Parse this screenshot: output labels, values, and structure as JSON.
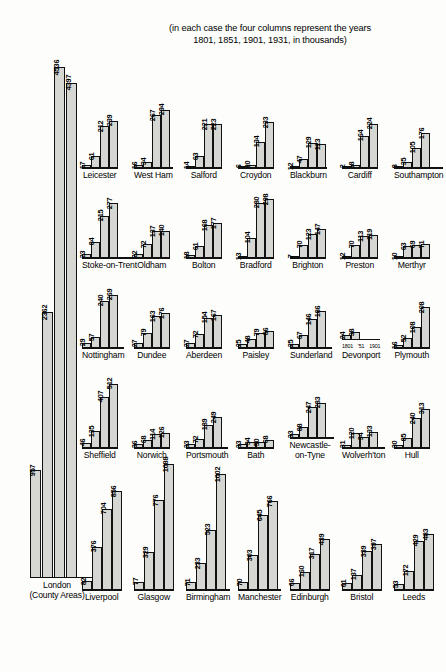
{
  "caption": {
    "line1": "(in each case the four columns represent the years",
    "line2": "1801, 1851, 1901, 1931, in thousands)"
  },
  "year_axis": {
    "ticks": [
      "1801",
      "'51",
      "1901"
    ],
    "years": [
      1801,
      1851,
      1901,
      1931
    ]
  },
  "chart_data": {
    "type": "bar",
    "title": "(in each case the four columns represent the years 1801, 1851, 1901, 1931, in thousands)",
    "xlabel": "",
    "ylabel": "Population (thousands)",
    "categories": [
      "1801",
      "1851",
      "1901",
      "1931"
    ],
    "units": "thousands",
    "panels": [
      {
        "name": "London",
        "name2": "(County Areas)",
        "values": [
          957,
          2362,
          4536,
          4397
        ]
      },
      {
        "name": "Leicester",
        "values": [
          17,
          61,
          212,
          239
        ]
      },
      {
        "name": "West Ham",
        "values": [
          16,
          34,
          267,
          294
        ]
      },
      {
        "name": "Salford",
        "values": [
          14,
          63,
          221,
          223
        ]
      },
      {
        "name": "Croydon",
        "values": [
          6,
          20,
          134,
          233
        ]
      },
      {
        "name": "Blackburn",
        "values": [
          12,
          47,
          129,
          123
        ]
      },
      {
        "name": "Cardiff",
        "values": [
          2,
          18,
          164,
          224
        ]
      },
      {
        "name": "Southampton",
        "values": [
          8,
          35,
          105,
          176
        ]
      },
      {
        "name": "Stoke-on-Trent",
        "values": [
          23,
          84,
          215,
          277
        ]
      },
      {
        "name": "Oldham",
        "values": [
          22,
          72,
          137,
          140
        ]
      },
      {
        "name": "Bolton",
        "values": [
          18,
          61,
          168,
          177
        ]
      },
      {
        "name": "Bradford",
        "values": [
          13,
          104,
          280,
          298
        ]
      },
      {
        "name": "Brighton",
        "values": [
          7,
          70,
          123,
          147
        ]
      },
      {
        "name": "Preston",
        "values": [
          12,
          70,
          113,
          119
        ]
      },
      {
        "name": "Merthyr",
        "values": [
          10,
          63,
          69,
          71
        ]
      },
      {
        "name": "Nottingham",
        "values": [
          29,
          57,
          240,
          269
        ]
      },
      {
        "name": "Dundee",
        "values": [
          27,
          79,
          163,
          176
        ]
      },
      {
        "name": "Aberdeen",
        "values": [
          27,
          72,
          154,
          167
        ]
      },
      {
        "name": "Paisley",
        "values": [
          25,
          48,
          79,
          86
        ]
      },
      {
        "name": "Sunderland",
        "values": [
          25,
          67,
          146,
          186
        ]
      },
      {
        "name": "Devonport",
        "values": [
          24,
          38
        ]
      },
      {
        "name": "Plymouth",
        "values": [
          16,
          52,
          108,
          208
        ]
      },
      {
        "name": "Sheffield",
        "values": [
          46,
          135,
          407,
          512
        ]
      },
      {
        "name": "Norwich",
        "values": [
          36,
          68,
          114,
          126
        ]
      },
      {
        "name": "Portsmouth",
        "values": [
          33,
          72,
          189,
          249
        ]
      },
      {
        "name": "Bath",
        "values": [
          33,
          54,
          50,
          68
        ]
      },
      {
        "name": "Newcastle-on-Tyne",
        "name2": "on-Tyne",
        "values": [
          33,
          88,
          247,
          283
        ]
      },
      {
        "name": "Wolverh'ton",
        "values": [
          31,
          120,
          94,
          133
        ]
      },
      {
        "name": "Hull",
        "values": [
          30,
          85,
          240,
          313
        ]
      },
      {
        "name": "Liverpool",
        "values": [
          82,
          376,
          704,
          856
        ]
      },
      {
        "name": "Glasgow",
        "values": [
          77,
          329,
          776,
          1088
        ]
      },
      {
        "name": "Birmingham",
        "values": [
          71,
          233,
          523,
          1002
        ]
      },
      {
        "name": "Manchester",
        "values": [
          70,
          303,
          645,
          766
        ]
      },
      {
        "name": "Edinburgh",
        "values": [
          66,
          160,
          317,
          439
        ]
      },
      {
        "name": "Bristol",
        "values": [
          61,
          137,
          339,
          397
        ]
      },
      {
        "name": "Leeds",
        "values": [
          53,
          172,
          429,
          483
        ]
      }
    ]
  },
  "layout": {
    "rows": [
      {
        "id": "row-1",
        "top": 96,
        "plotHeight": 60,
        "scaleMax": 300,
        "panels": [
          "Leicester",
          "West Ham",
          "Salford",
          "Croydon",
          "Blackburn",
          "Cardiff",
          "Southampton"
        ]
      },
      {
        "id": "row-2",
        "top": 186,
        "plotHeight": 60,
        "scaleMax": 300,
        "panels": [
          "Stoke-on-Trent",
          "Oldham",
          "Bolton",
          "Bradford",
          "Brighton",
          "Preston",
          "Merthyr"
        ]
      },
      {
        "id": "row-3",
        "top": 276,
        "plotHeight": 60,
        "scaleMax": 300,
        "panels": [
          "Nottingham",
          "Dundee",
          "Aberdeen",
          "Paisley",
          "Sunderland",
          "Devonport",
          "Plymouth"
        ]
      },
      {
        "id": "row-4",
        "top": 370,
        "plotHeight": 66,
        "scaleMax": 520,
        "panels": [
          "Sheffield",
          "Norwich",
          "Portsmouth",
          "Bath",
          "Newcastle-on-Tyne",
          "Wolverh'ton",
          "Hull"
        ]
      },
      {
        "id": "row-5",
        "top": 450,
        "plotHeight": 128,
        "scaleMax": 1100,
        "panels": [
          "Liverpool",
          "Glasgow",
          "Birmingham",
          "Manchester",
          "Edinburgh",
          "Bristol",
          "Leeds"
        ]
      }
    ],
    "london": {
      "left": 30,
      "top": 60,
      "plotHeight": 518,
      "scaleMax": 4600
    }
  },
  "colors": {
    "bar_fill": "#d6d6d2",
    "bar_stroke": "#111111",
    "background": "#fdfdfb",
    "text": "#000000"
  }
}
